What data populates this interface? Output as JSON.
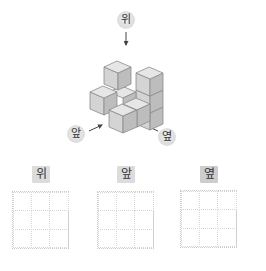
{
  "directions": {
    "top": {
      "label": "위",
      "icon": "arrow-down-icon"
    },
    "front": {
      "label": "앞",
      "icon": "arrow-up-right-icon"
    },
    "side": {
      "label": "옆",
      "icon": "arrow-up-left-icon"
    }
  },
  "cube_figure": {
    "description": "isometric stack of unit cubes",
    "cube_color_top": "#e6e6e6",
    "cube_color_left": "#d4d4d4",
    "cube_color_right": "#bdbdbd",
    "edge_color": "#8a8a8a"
  },
  "answer_grids": [
    {
      "label": "위",
      "rows": 3,
      "cols": 3
    },
    {
      "label": "앞",
      "rows": 3,
      "cols": 3
    },
    {
      "label": "옆",
      "rows": 3,
      "cols": 3
    }
  ]
}
